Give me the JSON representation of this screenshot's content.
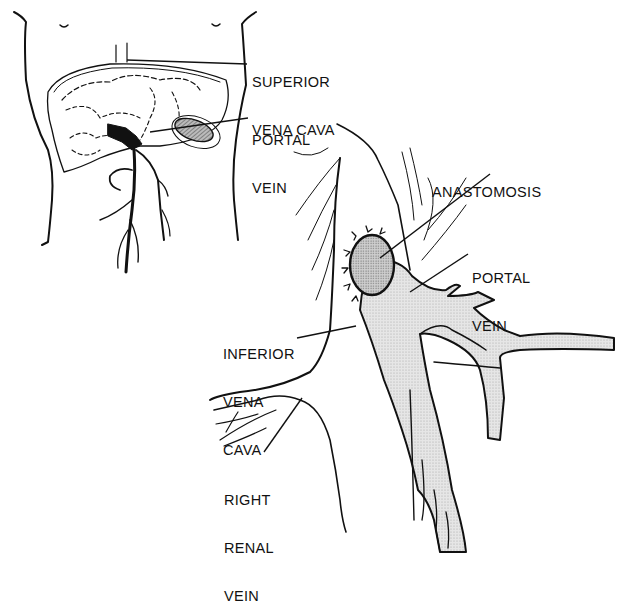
{
  "figure": {
    "type": "anatomical illustration",
    "colors": {
      "ink": "#111111",
      "vessel_fill": "#e3e3e3",
      "anastomosis_fill": "#bdbdbd",
      "background": "#ffffff"
    }
  },
  "inset": {
    "labels": {
      "superior_vena_cava": [
        "SUPERIOR",
        "VENA CAVA"
      ],
      "portal_vein": [
        "PORTAL",
        "VEIN"
      ]
    }
  },
  "main": {
    "labels": {
      "anastomosis": [
        "ANASTOMOSIS"
      ],
      "portal_vein": [
        "PORTAL",
        "VEIN"
      ],
      "inferior_vena_cava": [
        "INFERIOR",
        "VENA",
        "CAVA"
      ],
      "right_renal_vein": [
        "RIGHT",
        "RENAL",
        "VEIN"
      ]
    }
  }
}
